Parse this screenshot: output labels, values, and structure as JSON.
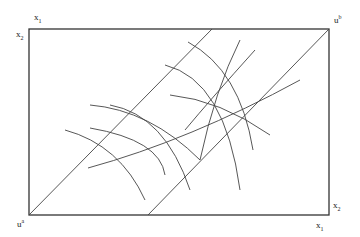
{
  "diagram": {
    "type": "edgeworth-box",
    "labels": {
      "top_left_x": {
        "base": "x",
        "sub": "1"
      },
      "top_left_y": {
        "base": "x",
        "sub": "2"
      },
      "top_right": {
        "base": "u",
        "sup": "b"
      },
      "bottom_left": {
        "base": "u",
        "sup": "a"
      },
      "bottom_right_y": {
        "base": "x",
        "sub": "2"
      },
      "bottom_right_x": {
        "base": "x",
        "sub": "1"
      }
    },
    "colors": {
      "line": "#444444",
      "box": "#333333"
    }
  }
}
